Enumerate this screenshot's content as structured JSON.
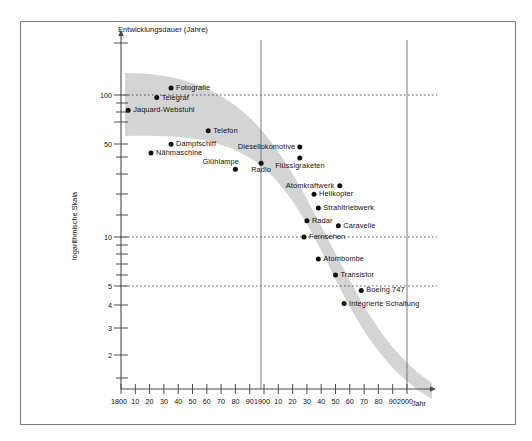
{
  "chart_data": {
    "type": "scatter",
    "title": "Entwicklungsdauer (Jahre)",
    "xlabel": "Jahr",
    "ylabel": "logarithmische Skala",
    "yscale": "log",
    "y_tick_labels": [
      "100",
      "50",
      "10",
      "5",
      "4",
      "3",
      "2"
    ],
    "x_tick_labels": [
      "1800",
      "10",
      "20",
      "30",
      "40",
      "50",
      "60",
      "70",
      "80",
      "90",
      "1900",
      "10",
      "20",
      "30",
      "40",
      "50",
      "60",
      "70",
      "80",
      "90",
      "2000"
    ],
    "gridlines": {
      "horizontal_dotted": [
        100,
        10,
        5
      ],
      "vertical_solid": [
        1900,
        2000
      ]
    },
    "band_label": "Streuband der Entwicklungsdauer",
    "points": [
      {
        "label": "Fotografie",
        "year": 1835,
        "years_to_develop": 112
      },
      {
        "label": "Telegraf",
        "year": 1825,
        "years_to_develop": 96
      },
      {
        "label": "Jaquard-Webstuhl",
        "year": 1805,
        "years_to_develop": 78
      },
      {
        "label": "Telefon",
        "year": 1861,
        "years_to_develop": 56
      },
      {
        "label": "Dampfschiff",
        "year": 1835,
        "years_to_develop": 45
      },
      {
        "label": "Nähmaschine",
        "year": 1821,
        "years_to_develop": 39
      },
      {
        "label": "Glühlampe",
        "year": 1880,
        "years_to_develop": 30
      },
      {
        "label": "Radio",
        "year": 1898,
        "years_to_develop": 33
      },
      {
        "label": "Diesellokomotive",
        "year": 1925,
        "years_to_develop": 43
      },
      {
        "label": "Flüssigraketen",
        "year": 1925,
        "years_to_develop": 36
      },
      {
        "label": "Atomkraftwerk",
        "year": 1953,
        "years_to_develop": 23
      },
      {
        "label": "Helikopter",
        "year": 1935,
        "years_to_develop": 20
      },
      {
        "label": "Strahltriebwerk",
        "year": 1938,
        "years_to_develop": 16
      },
      {
        "label": "Radar",
        "year": 1930,
        "years_to_develop": 13
      },
      {
        "label": "Caravelle",
        "year": 1952,
        "years_to_develop": 12
      },
      {
        "label": "Fernsehen",
        "year": 1928,
        "years_to_develop": 10
      },
      {
        "label": "Atombombe",
        "year": 1938,
        "years_to_develop": 7
      },
      {
        "label": "Transistor",
        "year": 1950,
        "years_to_develop": 5.4
      },
      {
        "label": "Boeing 747",
        "year": 1968,
        "years_to_develop": 4.2
      },
      {
        "label": "Integrierte Schaltung",
        "year": 1956,
        "years_to_develop": 3.4
      }
    ]
  },
  "icons": {
    "band": "shaded-trend-band"
  }
}
